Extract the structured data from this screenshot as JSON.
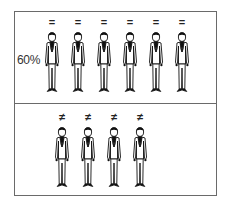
{
  "diagram": {
    "top_panel": {
      "label": "60%",
      "symbol": "=",
      "figure_count": 6,
      "figure_x": [
        41,
        67,
        93,
        119,
        145,
        171
      ]
    },
    "bottom_panel": {
      "symbol": "≠",
      "figure_count": 4,
      "figure_x": [
        51,
        77,
        103,
        129
      ]
    },
    "figure_icon": "man-in-suit-icon",
    "colors": {
      "border": "#6a6a6a",
      "ink": "#111111",
      "background": "#ffffff"
    }
  }
}
